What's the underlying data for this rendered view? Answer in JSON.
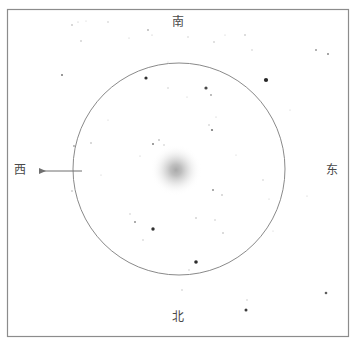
{
  "figure": {
    "kind": "astronomical-eyepiece-sketch",
    "width": 355,
    "height": 341,
    "background_color": "#ffffff"
  },
  "frame": {
    "name": "outer-border",
    "x": 7.5,
    "y": 9.5,
    "width": 341,
    "height": 327,
    "stroke_color": "#8c8c8c",
    "stroke_width": 1.2
  },
  "field_of_view": {
    "name": "eyepiece-field-circle",
    "center_x": 179,
    "center_y": 169,
    "radius": 106,
    "stroke_color": "#8a8a8a",
    "stroke_width": 1
  },
  "deep_sky_object": {
    "name": "diffuse-nebulosity",
    "center_x": 176,
    "center_y": 170,
    "radius": 26,
    "core_color": "#9a9a9a",
    "edge_color": "#ffffff"
  },
  "direction_labels": {
    "south": "南",
    "north": "北",
    "west": "西",
    "east": "东",
    "text_color": "#4a4a4a"
  },
  "drift_arrow": {
    "name": "west-drift-arrow",
    "tail_x": 82,
    "tail_y": 171,
    "head_x": 39,
    "head_y": 171,
    "stroke_color": "#6f6f6f",
    "stroke_width": 1
  },
  "stars": [
    {
      "x": 72,
      "y": 25,
      "r": 0.8,
      "o": 0.38
    },
    {
      "x": 78,
      "y": 22,
      "r": 0.6,
      "o": 0.3
    },
    {
      "x": 86,
      "y": 21,
      "r": 0.5,
      "o": 0.25
    },
    {
      "x": 108,
      "y": 22,
      "r": 0.7,
      "o": 0.3
    },
    {
      "x": 129,
      "y": 38,
      "r": 0.6,
      "o": 0.26
    },
    {
      "x": 148,
      "y": 30,
      "r": 0.9,
      "o": 0.34
    },
    {
      "x": 152,
      "y": 35,
      "r": 0.6,
      "o": 0.28
    },
    {
      "x": 188,
      "y": 37,
      "r": 0.7,
      "o": 0.26
    },
    {
      "x": 214,
      "y": 42,
      "r": 0.8,
      "o": 0.3
    },
    {
      "x": 81,
      "y": 41,
      "r": 0.8,
      "o": 0.32
    },
    {
      "x": 62,
      "y": 75,
      "r": 1.0,
      "o": 0.6
    },
    {
      "x": 225,
      "y": 35,
      "r": 0.6,
      "o": 0.24
    },
    {
      "x": 316,
      "y": 50,
      "r": 1.0,
      "o": 0.44
    },
    {
      "x": 328,
      "y": 54,
      "r": 1.0,
      "o": 0.52
    },
    {
      "x": 245,
      "y": 35,
      "r": 0.8,
      "o": 0.33
    },
    {
      "x": 252,
      "y": 50,
      "r": 0.7,
      "o": 0.28
    },
    {
      "x": 146,
      "y": 78,
      "r": 1.6,
      "o": 0.9
    },
    {
      "x": 266,
      "y": 80,
      "r": 2.1,
      "o": 0.95
    },
    {
      "x": 206,
      "y": 88,
      "r": 1.6,
      "o": 0.8
    },
    {
      "x": 211,
      "y": 95,
      "r": 0.9,
      "o": 0.42
    },
    {
      "x": 168,
      "y": 88,
      "r": 0.7,
      "o": 0.28
    },
    {
      "x": 187,
      "y": 97,
      "r": 0.6,
      "o": 0.24
    },
    {
      "x": 168,
      "y": 62,
      "r": 0.6,
      "o": 0.22
    },
    {
      "x": 212,
      "y": 130,
      "r": 1.1,
      "o": 0.6
    },
    {
      "x": 209,
      "y": 125,
      "r": 0.7,
      "o": 0.32
    },
    {
      "x": 153,
      "y": 144,
      "r": 1.0,
      "o": 0.55
    },
    {
      "x": 159,
      "y": 140,
      "r": 0.8,
      "o": 0.42
    },
    {
      "x": 164,
      "y": 145,
      "r": 0.7,
      "o": 0.3
    },
    {
      "x": 140,
      "y": 156,
      "r": 0.6,
      "o": 0.26
    },
    {
      "x": 74,
      "y": 146,
      "r": 0.9,
      "o": 0.42
    },
    {
      "x": 91,
      "y": 143,
      "r": 0.8,
      "o": 0.36
    },
    {
      "x": 216,
      "y": 117,
      "r": 0.6,
      "o": 0.26
    },
    {
      "x": 72,
      "y": 191,
      "r": 0.8,
      "o": 0.34
    },
    {
      "x": 213,
      "y": 190,
      "r": 1.0,
      "o": 0.48
    },
    {
      "x": 222,
      "y": 195,
      "r": 0.8,
      "o": 0.34
    },
    {
      "x": 215,
      "y": 220,
      "r": 0.7,
      "o": 0.3
    },
    {
      "x": 196,
      "y": 218,
      "r": 0.8,
      "o": 0.32
    },
    {
      "x": 130,
      "y": 214,
      "r": 0.7,
      "o": 0.28
    },
    {
      "x": 135,
      "y": 222,
      "r": 1.0,
      "o": 0.48
    },
    {
      "x": 153,
      "y": 229,
      "r": 1.7,
      "o": 0.9
    },
    {
      "x": 143,
      "y": 240,
      "r": 0.7,
      "o": 0.3
    },
    {
      "x": 223,
      "y": 233,
      "r": 0.8,
      "o": 0.34
    },
    {
      "x": 263,
      "y": 180,
      "r": 0.7,
      "o": 0.28
    },
    {
      "x": 269,
      "y": 199,
      "r": 0.6,
      "o": 0.24
    },
    {
      "x": 196,
      "y": 262,
      "r": 1.8,
      "o": 0.92
    },
    {
      "x": 247,
      "y": 300,
      "r": 0.7,
      "o": 0.28
    },
    {
      "x": 246,
      "y": 310,
      "r": 1.5,
      "o": 0.85
    },
    {
      "x": 182,
      "y": 290,
      "r": 0.7,
      "o": 0.3
    },
    {
      "x": 189,
      "y": 270,
      "r": 0.7,
      "o": 0.28
    },
    {
      "x": 326,
      "y": 293,
      "r": 1.3,
      "o": 0.7
    },
    {
      "x": 307,
      "y": 196,
      "r": 0.6,
      "o": 0.24
    },
    {
      "x": 273,
      "y": 231,
      "r": 0.6,
      "o": 0.22
    },
    {
      "x": 101,
      "y": 175,
      "r": 0.6,
      "o": 0.24
    },
    {
      "x": 236,
      "y": 155,
      "r": 0.6,
      "o": 0.22
    },
    {
      "x": 108,
      "y": 120,
      "r": 0.6,
      "o": 0.22
    },
    {
      "x": 290,
      "y": 110,
      "r": 0.6,
      "o": 0.22
    }
  ]
}
